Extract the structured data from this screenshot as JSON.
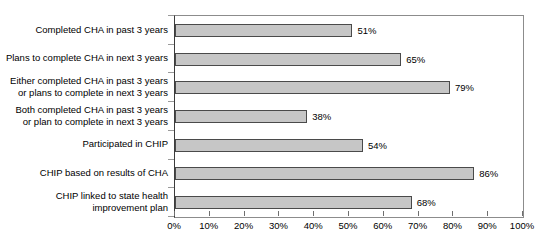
{
  "chart_data": {
    "type": "bar",
    "orientation": "horizontal",
    "title": "",
    "xlabel": "",
    "ylabel": "",
    "xlim": [
      0,
      100
    ],
    "grid": false,
    "legend": false,
    "categories": [
      "Completed CHA in past 3 years",
      "Plans to complete CHA in next 3 years",
      "Either completed CHA in past 3 years\nor plans to complete in next 3 years",
      "Both completed CHA in past 3 years\nor plan to complete in next 3 years",
      "Participated in CHIP",
      "CHIP based on results of CHA",
      "CHIP linked to state health\nimprovement plan"
    ],
    "values": [
      51,
      65,
      79,
      38,
      54,
      86,
      68
    ],
    "value_labels": [
      "51%",
      "65%",
      "79%",
      "38%",
      "54%",
      "86%",
      "68%"
    ],
    "xticks": [
      0,
      10,
      20,
      30,
      40,
      50,
      60,
      70,
      80,
      90,
      100
    ],
    "xtick_labels": [
      "0%",
      "10%",
      "20%",
      "30%",
      "40%",
      "50%",
      "60%",
      "70%",
      "80%",
      "90%",
      "100%"
    ],
    "bar_fill_color": "#c6c6c6",
    "bar_border_color": "#4a4a4a",
    "axis_color": "#6f6f6f",
    "text_color": "#000000",
    "background_color": "#ffffff"
  }
}
